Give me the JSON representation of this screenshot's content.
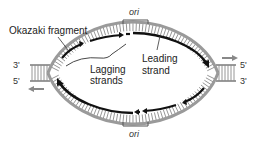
{
  "diagram": {
    "labels": {
      "okazaki": "Okazaki fragment",
      "lagging_line1": "Lagging",
      "lagging_line2": "strands",
      "leading_line1": "Leading",
      "leading_line2": "strand",
      "ori_top": "ori",
      "ori_bottom": "ori"
    },
    "ends": {
      "left_top": "3'",
      "left_bottom": "5'",
      "right_top": "5'",
      "right_bottom": "3'"
    },
    "fork_directions": {
      "left": "left",
      "right": "right"
    },
    "colors": {
      "parental_strand": "#9a9a9a",
      "new_strand": "#111111",
      "text": "#222222",
      "arrow": "#888888"
    }
  }
}
